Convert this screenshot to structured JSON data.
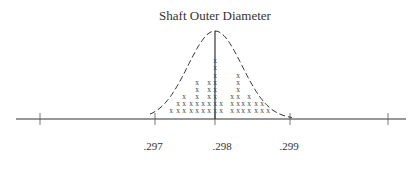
{
  "chart_data": {
    "type": "dot_plot_with_normal_curve",
    "title": "Shaft Outer Diameter",
    "xlabel": "",
    "ylabel": "",
    "tick_labels": [
      ".297",
      ".298",
      ".299"
    ],
    "tick_values": [
      0.297,
      0.298,
      0.299
    ],
    "marker": "x",
    "center_line": 0.298,
    "overlay": "normal distribution curve (dashed)",
    "columns": [
      {
        "x_px": 171,
        "count": 1
      },
      {
        "x_px": 178,
        "count": 2
      },
      {
        "x_px": 184,
        "count": 3
      },
      {
        "x_px": 191,
        "count": 2
      },
      {
        "x_px": 197,
        "count": 5
      },
      {
        "x_px": 203,
        "count": 2
      },
      {
        "x_px": 209,
        "count": 5
      },
      {
        "x_px": 215,
        "count": 8
      },
      {
        "x_px": 221,
        "count": 2
      },
      {
        "x_px": 232,
        "count": 3
      },
      {
        "x_px": 238,
        "count": 6
      },
      {
        "x_px": 243,
        "count": 2
      },
      {
        "x_px": 249,
        "count": 3
      },
      {
        "x_px": 256,
        "count": 2
      },
      {
        "x_px": 262,
        "count": 2
      },
      {
        "x_px": 268,
        "count": 1
      }
    ],
    "grid": false,
    "legend": null
  },
  "axis": {
    "baseline_y": 119,
    "x_start": 16,
    "x_end": 406,
    "tick_positions": [
      40,
      155,
      215,
      290,
      388
    ],
    "labels": [
      {
        "text": ".297",
        "x": 153
      },
      {
        "text": ".298",
        "x": 222
      },
      {
        "text": ".299",
        "x": 289
      }
    ]
  }
}
